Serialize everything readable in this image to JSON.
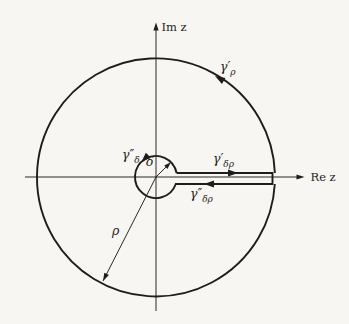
{
  "figure": {
    "background": "#f7f6f2",
    "ink": "#1e1d1b"
  },
  "axes": {
    "im": "Im z",
    "re": "Re z"
  },
  "labels": {
    "outer_circle": {
      "base": "γ′",
      "sub": "ρ"
    },
    "upper_bank": {
      "base": "γ′",
      "sub": "δρ"
    },
    "lower_bank": {
      "base": "γ″",
      "sub": "δρ"
    },
    "inner_circle": {
      "base": "γ″",
      "sub": "δ"
    },
    "outer_radius": "ρ",
    "inner_radius": "δ"
  }
}
